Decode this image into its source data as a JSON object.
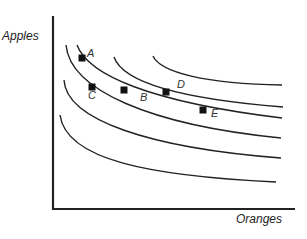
{
  "chart_data": {
    "type": "line",
    "title": "",
    "xlabel": "Oranges",
    "ylabel": "Apples",
    "grid": false,
    "legend": null,
    "curves": [
      {
        "name": "curve-1",
        "path": "M153,56 C160,72 205,84 282,85"
      },
      {
        "name": "curve-2",
        "path": "M114,57 C122,80 170,98 283,107"
      },
      {
        "name": "curve-3",
        "path": "M77,45 C88,75 150,102 282,118"
      },
      {
        "name": "curve-4",
        "path": "M66,45 C70,90 150,125 281,138"
      },
      {
        "name": "curve-5",
        "path": "M64,80 C66,120 150,148 281,158"
      },
      {
        "name": "curve-6",
        "path": "M60,115 C66,160 150,176 276,182"
      }
    ],
    "points": [
      {
        "label": "A",
        "x": 82,
        "y": 58,
        "lx": 87,
        "ly": 53
      },
      {
        "label": "B",
        "x": 124,
        "y": 90,
        "lx": 140,
        "ly": 97
      },
      {
        "label": "C",
        "x": 92,
        "y": 87,
        "lx": 88,
        "ly": 95
      },
      {
        "label": "D",
        "x": 166,
        "y": 92,
        "lx": 177,
        "ly": 84
      },
      {
        "label": "E",
        "x": 203,
        "y": 110,
        "lx": 211,
        "ly": 113
      }
    ],
    "axes": {
      "origin": [
        53,
        209
      ],
      "y_top": 16,
      "x_right": 295
    }
  },
  "labels": {
    "y_axis": "Apples",
    "x_axis": "Oranges"
  }
}
